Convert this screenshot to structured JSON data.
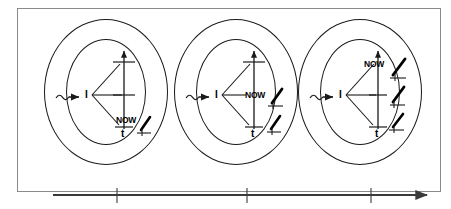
{
  "figure": {
    "type": "conceptual-diagram",
    "title": "",
    "background_color": "#ffffff",
    "frame": {
      "border_color": "#8a8a8a",
      "fill": "#ffffff"
    },
    "ink_color": "#1a1a1a"
  },
  "panels": [
    {
      "index": 1,
      "name": "snapshot-1",
      "self_label": "I",
      "now_label": "NOW",
      "time_axis_label": "t",
      "now_position": "bottom",
      "now_fraction": 0.15,
      "event_marks": 1,
      "input_arrow": "squiggle-arrow",
      "rings": 2
    },
    {
      "index": 2,
      "name": "snapshot-2",
      "self_label": "I",
      "now_label": "NOW",
      "time_axis_label": "t",
      "now_position": "middle",
      "now_fraction": 0.5,
      "event_marks": 2,
      "input_arrow": "squiggle-arrow",
      "rings": 2
    },
    {
      "index": 3,
      "name": "snapshot-3",
      "self_label": "I",
      "now_label": "NOW",
      "time_axis_label": "t",
      "now_position": "top",
      "now_fraction": 0.85,
      "event_marks": 3,
      "input_arrow": "squiggle-arrow",
      "rings": 2
    }
  ],
  "timeline": {
    "name": "time-axis",
    "direction": "left-to-right",
    "arrowhead": "right",
    "tick_count": 3,
    "color": "#3a3a3a",
    "label": ""
  }
}
